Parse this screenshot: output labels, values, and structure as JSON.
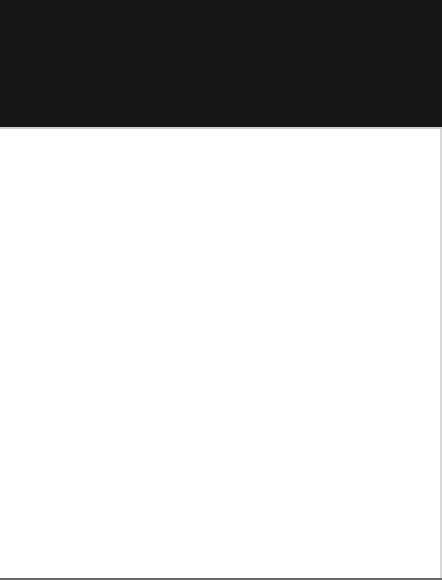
{
  "window": {
    "header_color": "#161616",
    "content_color": "#fefefe",
    "state": "blank"
  },
  "content": {
    "ghost_strip": {
      "left_text": "",
      "right_text": ""
    }
  }
}
